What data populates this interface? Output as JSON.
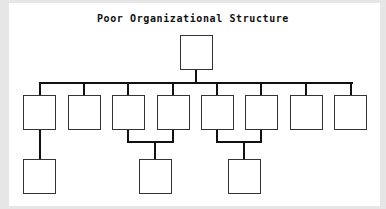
{
  "diagram": {
    "title": "Poor Organizational Structure",
    "colors": {
      "background": "#e6e6e6",
      "panel": "#ffffff",
      "line": "#111111",
      "box_border": "#333333"
    },
    "nodes": [
      {
        "id": "top",
        "level": 0,
        "label": ""
      },
      {
        "id": "l1-1",
        "level": 1,
        "label": ""
      },
      {
        "id": "l1-2",
        "level": 1,
        "label": ""
      },
      {
        "id": "l1-3",
        "level": 1,
        "label": ""
      },
      {
        "id": "l1-4",
        "level": 1,
        "label": ""
      },
      {
        "id": "l1-5",
        "level": 1,
        "label": ""
      },
      {
        "id": "l1-6",
        "level": 1,
        "label": ""
      },
      {
        "id": "l1-7",
        "level": 1,
        "label": ""
      },
      {
        "id": "l1-8",
        "level": 1,
        "label": ""
      },
      {
        "id": "l2-1",
        "level": 2,
        "label": ""
      },
      {
        "id": "l2-2",
        "level": 2,
        "label": ""
      },
      {
        "id": "l2-3",
        "level": 2,
        "label": ""
      }
    ],
    "edges": [
      [
        "top",
        "l1-1"
      ],
      [
        "top",
        "l1-2"
      ],
      [
        "top",
        "l1-3"
      ],
      [
        "top",
        "l1-4"
      ],
      [
        "top",
        "l1-5"
      ],
      [
        "top",
        "l1-6"
      ],
      [
        "top",
        "l1-7"
      ],
      [
        "top",
        "l1-8"
      ],
      [
        "l1-1",
        "l2-1"
      ],
      [
        "l1-3",
        "l2-2"
      ],
      [
        "l1-4",
        "l2-2"
      ],
      [
        "l1-5",
        "l2-3"
      ],
      [
        "l1-6",
        "l2-3"
      ]
    ]
  }
}
